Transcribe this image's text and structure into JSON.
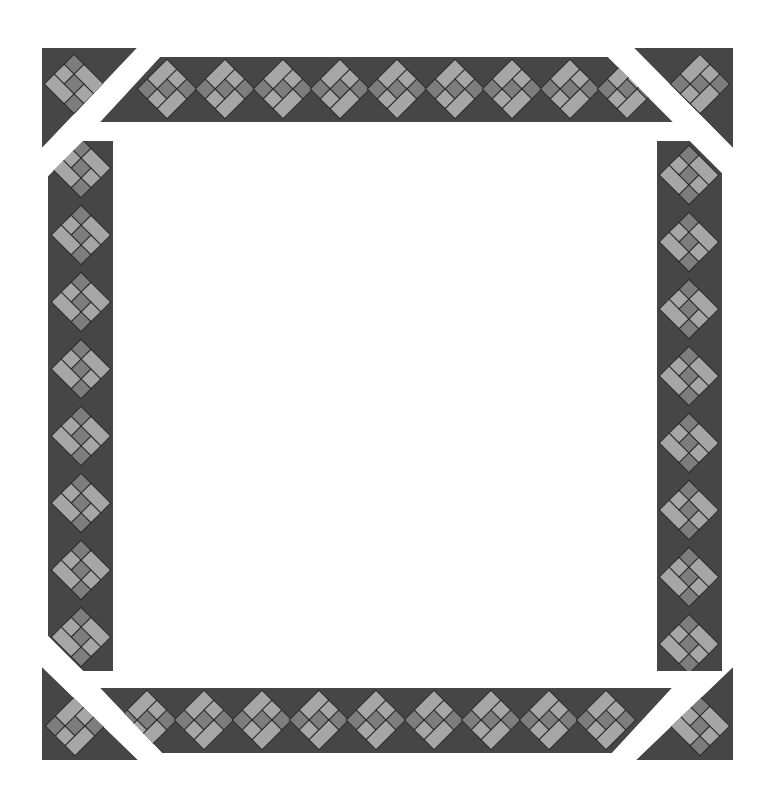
{
  "diagram": {
    "title": "",
    "colors": {
      "background": "#ffffff",
      "dark": "#464646",
      "mid": "#7d7d7d",
      "light": "#a6a6a6",
      "outline": "#2b2b2b"
    },
    "block": {
      "type": "on-point pieced block",
      "grid": "3x3",
      "cells": [
        {
          "id": "long-top",
          "cells": [
            [
              0,
              0
            ],
            [
              1,
              0
            ]
          ],
          "color": "light"
        },
        {
          "id": "small-top",
          "cells": [
            [
              0,
              1
            ]
          ],
          "color": "light"
        },
        {
          "id": "corner-right",
          "cells": [
            [
              0,
              2
            ]
          ],
          "color": "mid"
        },
        {
          "id": "center",
          "cells": [
            [
              1,
              1
            ]
          ],
          "color": "mid"
        },
        {
          "id": "corner-left",
          "cells": [
            [
              2,
              0
            ]
          ],
          "color": "mid"
        },
        {
          "id": "small-bottom",
          "cells": [
            [
              2,
              1
            ]
          ],
          "color": "light"
        },
        {
          "id": "long-bottom",
          "cells": [
            [
              1,
              2
            ],
            [
              2,
              2
            ]
          ],
          "color": "light"
        }
      ]
    },
    "strips": [
      {
        "name": "top",
        "block_count": 8,
        "partial_blocks": 2
      },
      {
        "name": "bottom",
        "block_count": 8,
        "partial_blocks": 2
      },
      {
        "name": "left",
        "block_count": 8,
        "partial_blocks": 2
      },
      {
        "name": "right",
        "block_count": 8,
        "partial_blocks": 2
      }
    ],
    "corners": [
      "top-left",
      "top-right",
      "bottom-left",
      "bottom-right"
    ]
  }
}
